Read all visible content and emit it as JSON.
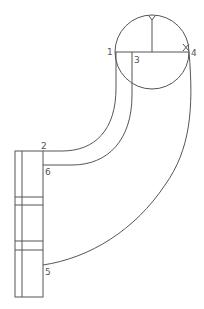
{
  "diagram": {
    "type": "technical-drawing",
    "stroke_color": "#555555",
    "background": "#ffffff",
    "labels": [
      {
        "id": "1",
        "text": "1"
      },
      {
        "id": "2",
        "text": "2"
      },
      {
        "id": "3",
        "text": "3"
      },
      {
        "id": "4",
        "text": "4"
      },
      {
        "id": "5",
        "text": "5"
      },
      {
        "id": "6",
        "text": "6"
      }
    ],
    "circle": {
      "cx": 152,
      "cy": 52,
      "r": 37
    },
    "rectangle": {
      "x": 15,
      "y": 151,
      "width": 28,
      "height": 146
    }
  }
}
